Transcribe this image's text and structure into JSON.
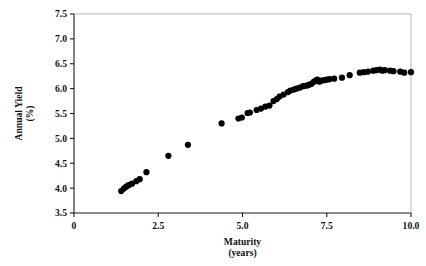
{
  "figure": {
    "background_color": "#ffffff",
    "ink_color": "#000000",
    "marker_color": "#000000",
    "marker_shape": "filled-circle"
  },
  "chart_data": {
    "type": "scatter",
    "title": "",
    "subtitle": "",
    "xlabel": "Maturity",
    "xlabel_units": "(years)",
    "ylabel": "Annual Yield",
    "ylabel_units": "(%)",
    "xlim": [
      0,
      10
    ],
    "ylim": [
      3.5,
      7.5
    ],
    "xticks": [
      0,
      2.5,
      5.0,
      7.5,
      10.0
    ],
    "xtick_labels": [
      "0",
      "2.5",
      "5.0",
      "7.5",
      "10.0"
    ],
    "yticks": [
      3.5,
      4.0,
      4.5,
      5.0,
      5.5,
      6.0,
      6.5,
      7.0,
      7.5
    ],
    "ytick_labels": [
      "3.5",
      "4.0",
      "4.5",
      "5.0",
      "5.5",
      "6.0",
      "6.5",
      "7.0",
      "7.5"
    ],
    "grid": false,
    "legend": null,
    "legend_position": "none",
    "series": [
      {
        "name": "Annual Yield vs Maturity",
        "marker": "filled-circle",
        "color": "#000000",
        "points": [
          [
            1.4,
            3.94
          ],
          [
            1.48,
            3.99
          ],
          [
            1.55,
            4.03
          ],
          [
            1.62,
            4.06
          ],
          [
            1.72,
            4.09
          ],
          [
            1.85,
            4.14
          ],
          [
            1.95,
            4.18
          ],
          [
            2.15,
            4.32
          ],
          [
            2.8,
            4.65
          ],
          [
            3.38,
            4.87
          ],
          [
            4.38,
            5.3
          ],
          [
            4.88,
            5.4
          ],
          [
            4.98,
            5.42
          ],
          [
            5.15,
            5.51
          ],
          [
            5.22,
            5.52
          ],
          [
            5.42,
            5.57
          ],
          [
            5.55,
            5.6
          ],
          [
            5.68,
            5.64
          ],
          [
            5.8,
            5.66
          ],
          [
            5.92,
            5.75
          ],
          [
            6.02,
            5.79
          ],
          [
            6.1,
            5.84
          ],
          [
            6.22,
            5.88
          ],
          [
            6.35,
            5.93
          ],
          [
            6.42,
            5.96
          ],
          [
            6.52,
            5.98
          ],
          [
            6.6,
            6.0
          ],
          [
            6.7,
            6.02
          ],
          [
            6.8,
            6.05
          ],
          [
            6.9,
            6.06
          ],
          [
            6.98,
            6.08
          ],
          [
            7.05,
            6.1
          ],
          [
            7.12,
            6.14
          ],
          [
            7.18,
            6.16
          ],
          [
            7.22,
            6.18
          ],
          [
            7.28,
            6.14
          ],
          [
            7.34,
            6.16
          ],
          [
            7.42,
            6.17
          ],
          [
            7.5,
            6.18
          ],
          [
            7.58,
            6.19
          ],
          [
            7.72,
            6.2
          ],
          [
            7.95,
            6.22
          ],
          [
            8.18,
            6.27
          ],
          [
            8.48,
            6.32
          ],
          [
            8.6,
            6.33
          ],
          [
            8.72,
            6.34
          ],
          [
            8.88,
            6.36
          ],
          [
            8.98,
            6.37
          ],
          [
            9.08,
            6.38
          ],
          [
            9.15,
            6.36
          ],
          [
            9.22,
            6.37
          ],
          [
            9.38,
            6.36
          ],
          [
            9.48,
            6.35
          ],
          [
            9.68,
            6.34
          ],
          [
            9.8,
            6.32
          ],
          [
            10.0,
            6.33
          ]
        ]
      }
    ]
  }
}
